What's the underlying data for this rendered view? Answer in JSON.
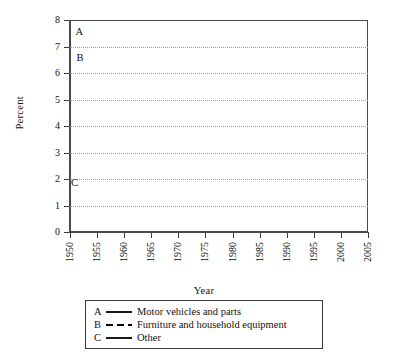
{
  "chart_data": {
    "type": "line",
    "title": "",
    "xlabel": "Year",
    "ylabel": "Percent",
    "xlim": [
      1950,
      2005
    ],
    "ylim": [
      0,
      8
    ],
    "ytick_step": 1,
    "grid": true,
    "grid_style": "dotted-horizontal",
    "legend_position": "below-axes",
    "x": [
      1950,
      1955,
      1960,
      1965,
      1970,
      1975,
      1980,
      1985,
      1990,
      1995,
      2000,
      2005
    ],
    "xticklabels": [
      "1950",
      "1955",
      "1960",
      "1965",
      "1970",
      "1975",
      "1980",
      "1985",
      "1990",
      "1995",
      "2000",
      "2005"
    ],
    "yticklabels": [
      "0",
      "1",
      "2",
      "3",
      "4",
      "5",
      "6",
      "7",
      "8"
    ],
    "series": [
      {
        "key": "A",
        "name": "Motor vehicles and parts",
        "style": "solid",
        "color": "#000000",
        "values": [
          7.1,
          6.8,
          5.9,
          6.7,
          5.5,
          5.3,
          5.0,
          6.5,
          5.5,
          5.0,
          5.0,
          5.1
        ]
      },
      {
        "key": "B",
        "name": "Furniture and household equipment",
        "style": "dashed",
        "color": "#000000",
        "values": [
          7.1,
          6.5,
          5.4,
          5.5,
          5.6,
          5.3,
          4.9,
          4.6,
          4.4,
          4.5,
          4.6,
          4.2
        ]
      },
      {
        "key": "C",
        "name": "Other",
        "style": "solid-thin",
        "color": "#444444",
        "values": [
          1.7,
          1.8,
          1.8,
          1.75,
          2.0,
          2.25,
          2.25,
          2.2,
          2.15,
          2.25,
          2.3,
          2.3
        ]
      }
    ],
    "annotations": [
      {
        "text": "A",
        "x": 1951.0,
        "y": 7.55
      },
      {
        "text": "B",
        "x": 1951.2,
        "y": 6.55
      },
      {
        "text": "C",
        "x": 1950.2,
        "y": 1.85
      }
    ]
  },
  "legend": {
    "rows": [
      {
        "letter": "A",
        "label": "Motor vehicles and parts",
        "style": "solid"
      },
      {
        "letter": "B",
        "label": "Furniture and household equipment",
        "style": "dashed"
      },
      {
        "letter": "C",
        "label": "Other",
        "style": "solid"
      }
    ]
  },
  "axes": {
    "y_title": "Percent",
    "x_title": "Year"
  }
}
